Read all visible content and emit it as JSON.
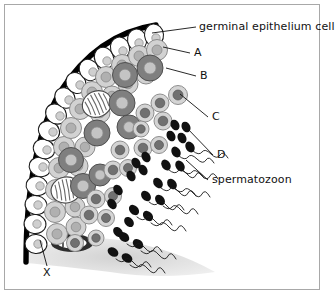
{
  "figure": {
    "background_color": "#ffffff",
    "frame_color": "#a8a8a8",
    "basement_membrane_color": "#000000",
    "interstitial_color": "#d9d9d9"
  },
  "labels": {
    "germinal_epithelium": "germinal epithelium cell",
    "a": "A",
    "b": "B",
    "c": "C",
    "d": "D",
    "spermatozoon": "spermatozoon",
    "x": "X"
  },
  "cell_types": {
    "epithelium": {
      "name": "germinal epithelium cell",
      "fill": "#ffffff",
      "stroke": "#111111"
    },
    "spermatogonium": {
      "name": "spermatogonium",
      "fill": "#d0d0d0",
      "nucleus": "#b4b4b4"
    },
    "primary_spermatocyte": {
      "name": "primary spermatocyte",
      "fill": "#8a8a8a",
      "nucleus": "#c2c2c2"
    },
    "secondary_spermatocyte": {
      "name": "secondary spermatocyte",
      "fill": "#cfcfcf",
      "nucleus": "#7d7d7d"
    },
    "spermatid": {
      "name": "spermatid",
      "fill": "#111111"
    },
    "spermatozoon": {
      "name": "spermatozoon",
      "head": "#111111",
      "tail": "#222222"
    },
    "dividing_cell": {
      "name": "dividing cell with chromosomes",
      "fill": "#ffffff",
      "stripes": "#555555"
    },
    "interstitial_structure": {
      "name": "interstitial cell cluster",
      "fill": "#333333",
      "stripes": "#ffffff"
    }
  },
  "leader_lines": [
    {
      "label": "germinal epithelium cell",
      "from": [
        196,
        27
      ],
      "to": [
        152,
        33
      ]
    },
    {
      "label": "A",
      "from": [
        190,
        53
      ],
      "to": [
        163,
        47
      ]
    },
    {
      "label": "B",
      "from": [
        196,
        76
      ],
      "to": [
        166,
        68
      ]
    },
    {
      "label": "C",
      "from": [
        208,
        117
      ],
      "to": [
        180,
        94
      ]
    },
    {
      "label": "D",
      "from": [
        213,
        155
      ],
      "to": [
        186,
        127
      ]
    },
    {
      "label": "spermatozoon",
      "from": [
        208,
        180
      ],
      "to": [
        186,
        160
      ]
    },
    {
      "label": "X",
      "from": [
        47,
        268
      ],
      "to": [
        40,
        240
      ]
    }
  ]
}
